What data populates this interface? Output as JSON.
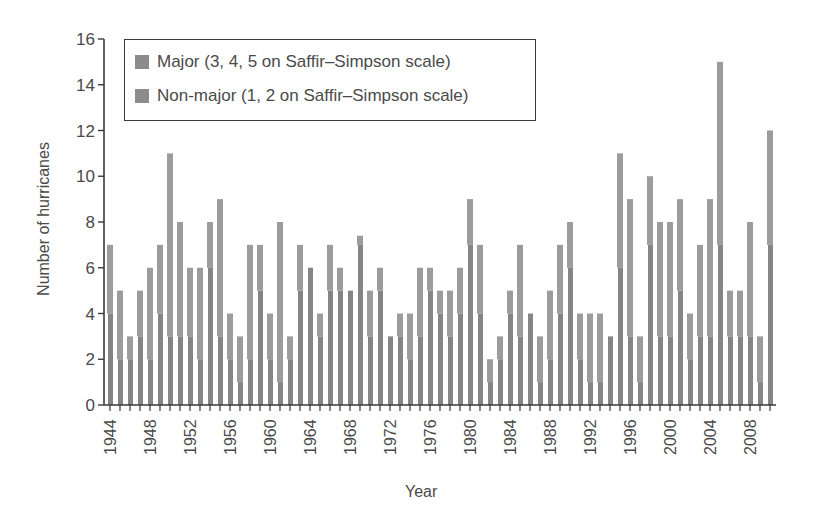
{
  "chart_data": {
    "type": "bar",
    "stacked": true,
    "title": "",
    "xlabel": "Year",
    "ylabel": "Number of hurricanes",
    "ylim": [
      0,
      16
    ],
    "yticks": [
      0,
      2,
      4,
      6,
      8,
      10,
      12,
      14,
      16
    ],
    "xtick_labels": [
      "1944",
      "1948",
      "1952",
      "1956",
      "1960",
      "1964",
      "1968",
      "1972",
      "1976",
      "1980",
      "1984",
      "1988",
      "1992",
      "1996",
      "2000",
      "2004",
      "2008"
    ],
    "legend_position": "upper-left",
    "grid": false,
    "categories": [
      1944,
      1945,
      1946,
      1947,
      1948,
      1949,
      1950,
      1951,
      1952,
      1953,
      1954,
      1955,
      1956,
      1957,
      1958,
      1959,
      1960,
      1961,
      1962,
      1963,
      1964,
      1965,
      1966,
      1967,
      1968,
      1969,
      1970,
      1971,
      1972,
      1973,
      1974,
      1975,
      1976,
      1977,
      1978,
      1979,
      1980,
      1981,
      1982,
      1983,
      1984,
      1985,
      1986,
      1987,
      1988,
      1989,
      1990,
      1991,
      1992,
      1993,
      1994,
      1995,
      1996,
      1997,
      1998,
      1999,
      2000,
      2001,
      2002,
      2003,
      2004,
      2005,
      2006,
      2007,
      2008,
      2009,
      2010
    ],
    "totals": [
      7,
      5,
      3,
      5,
      6,
      7,
      11,
      8,
      6,
      6,
      8,
      9,
      4,
      3,
      7,
      7,
      4,
      8,
      3,
      7,
      6,
      4,
      7,
      6,
      5,
      7.4,
      5,
      6,
      3,
      4,
      4,
      6,
      6,
      5,
      5,
      6,
      9,
      7,
      2,
      3,
      5,
      7,
      4,
      3,
      5,
      7,
      8,
      4,
      4,
      4,
      3,
      11,
      9,
      3,
      10,
      8,
      8,
      9,
      4,
      7,
      9,
      15,
      5,
      5,
      8,
      3,
      12
    ],
    "series": [
      {
        "name": "Major (3, 4, 5 on Saffir–Simpson scale)",
        "color": "#7f7f7f",
        "values": [
          4,
          2,
          2,
          3,
          2,
          4,
          3,
          3,
          3,
          2,
          6,
          3,
          2,
          1,
          2,
          5,
          2,
          1,
          2,
          5,
          6,
          3,
          5,
          5,
          5,
          7,
          3,
          5,
          3,
          3,
          2,
          3,
          5,
          4,
          3,
          4,
          7,
          4,
          1,
          2,
          4,
          3,
          4,
          1,
          2,
          4,
          6,
          2,
          1,
          1,
          3,
          6,
          3,
          1,
          7,
          3,
          3,
          5,
          2,
          3,
          3,
          7,
          3,
          3,
          3,
          1,
          7
        ]
      },
      {
        "name": "Non-major (1, 2 on Saffir–Simpson scale)",
        "color": "#9a9a9a",
        "values": [
          3,
          3,
          1,
          2,
          4,
          3,
          8,
          5,
          3,
          4,
          2,
          6,
          2,
          2,
          5,
          2,
          2,
          7,
          1,
          2,
          0,
          1,
          2,
          1,
          0,
          0.4,
          2,
          1,
          0,
          1,
          2,
          3,
          1,
          1,
          2,
          2,
          2,
          3,
          1,
          1,
          1,
          4,
          0,
          2,
          3,
          3,
          2,
          2,
          3,
          3,
          0,
          5,
          6,
          2,
          3,
          5,
          5,
          4,
          2,
          4,
          6,
          8,
          2,
          2,
          5,
          2,
          5
        ]
      }
    ]
  },
  "legend": {
    "major": "Major (3, 4, 5 on Saffir–Simpson scale)",
    "nonmajor": "Non-major (1, 2 on Saffir–Simpson scale)"
  },
  "axes": {
    "xlabel": "Year",
    "ylabel": "Number of hurricanes"
  }
}
